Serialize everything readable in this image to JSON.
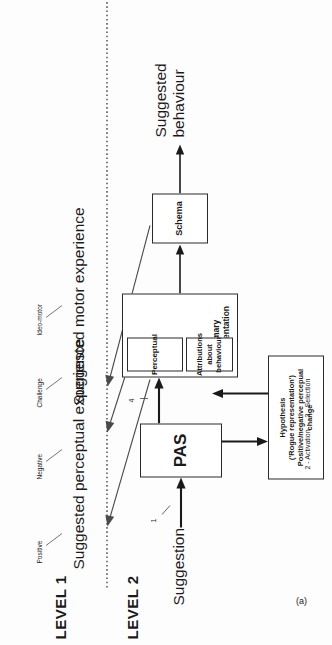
{
  "figure": {
    "panel_label": "(a)"
  },
  "levels": [
    {
      "label": "LEVEL 1"
    },
    {
      "label": "LEVEL 2"
    }
  ],
  "level1": {
    "outcomes": [
      {
        "label": "Suggested perceptual experience"
      },
      {
        "label": "Suggested motor experience"
      }
    ],
    "qualifiers": [
      {
        "label": "Positive"
      },
      {
        "label": "Negative"
      },
      {
        "label": "Challenge"
      },
      {
        "label": "Ideo-motor"
      }
    ]
  },
  "level2": {
    "inputs": [
      {
        "label": "Suggestion"
      }
    ],
    "outputs": [
      {
        "label": "Suggested\nbehaviour",
        "line1": "Suggested",
        "line2": "behaviour"
      }
    ],
    "boxes": [
      {
        "name": "pas",
        "label": "PAS"
      },
      {
        "name": "perceptual",
        "label": "Perceptual"
      },
      {
        "name": "attributions",
        "line1": "Attributions  about",
        "line2": "behaviour"
      },
      {
        "name": "primary-representation",
        "label": "Primary representation"
      },
      {
        "name": "schema",
        "label": "Schema"
      },
      {
        "name": "hypothesis",
        "line1": "Hypothesis",
        "line2": "('Rogue representation')",
        "line3": "Positive/negative percepual",
        "line4": "change"
      }
    ],
    "process_labels": [
      {
        "label": "1"
      },
      {
        "label": "2 - Activation"
      },
      {
        "label": "3 - Selection"
      },
      {
        "label": "4"
      }
    ]
  }
}
